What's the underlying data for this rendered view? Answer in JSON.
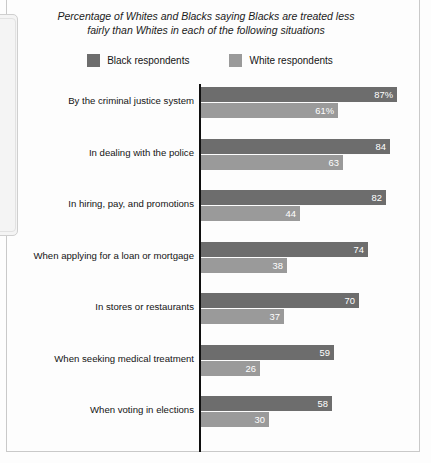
{
  "chart_data": {
    "type": "bar",
    "orientation": "horizontal",
    "grouped": true,
    "title": "Percentage of Whites and Blacks saying Blacks are treated less fairly than Whites in each of the following situations",
    "title_line1": "Percentage of Whites and Blacks saying Blacks are treated less",
    "title_line2": "fairly than Whites in each of the following situations",
    "xlabel": "",
    "ylabel": "",
    "xlim": [
      0,
      100
    ],
    "grid": false,
    "legend_position": "top-center",
    "categories": [
      "By the criminal justice system",
      "In dealing with the police",
      "In hiring, pay, and promotions",
      "When applying for a loan or mortgage",
      "In stores or restaurants",
      "When seeking medical treatment",
      "When voting in elections"
    ],
    "series": [
      {
        "name": "Black respondents",
        "color": "#6d6d6d",
        "values": [
          87,
          84,
          82,
          74,
          70,
          59,
          58
        ],
        "labels": [
          "87%",
          "84",
          "82",
          "74",
          "70",
          "59",
          "58"
        ]
      },
      {
        "name": "White respondents",
        "color": "#9a9a9a",
        "values": [
          61,
          63,
          44,
          38,
          37,
          26,
          30
        ],
        "labels": [
          "61%",
          "63",
          "44",
          "38",
          "37",
          "26",
          "30"
        ]
      }
    ]
  },
  "legend": {
    "items": [
      {
        "label": "Black respondents",
        "color": "#6d6d6d"
      },
      {
        "label": "White respondents",
        "color": "#9a9a9a"
      }
    ]
  }
}
